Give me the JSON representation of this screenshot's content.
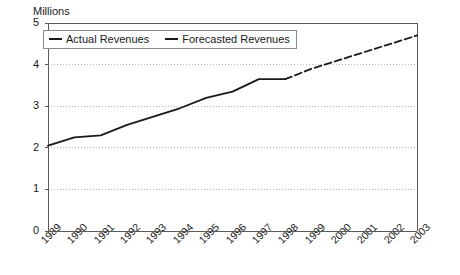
{
  "chart_data": {
    "type": "line",
    "title": "",
    "ylabel": "Millions",
    "xlabel": "",
    "ylim": [
      0,
      5
    ],
    "yticks": [
      "0",
      "1",
      "2",
      "3",
      "4",
      "5"
    ],
    "grid": true,
    "legend_position": "top-left-inside",
    "categories": [
      "1989",
      "1990",
      "1991",
      "1992",
      "1993",
      "1994",
      "1995",
      "1996",
      "1997",
      "1998",
      "1999",
      "2000",
      "2001",
      "2002",
      "2003"
    ],
    "series": [
      {
        "name": "Actual Revenues",
        "style": "solid",
        "color": "#1a1a1a",
        "values": [
          2.05,
          2.25,
          2.3,
          2.55,
          2.75,
          2.95,
          3.2,
          3.35,
          3.65,
          3.65,
          null,
          null,
          null,
          null,
          null
        ]
      },
      {
        "name": "Forecasted Revenues",
        "style": "dashed",
        "color": "#1a1a1a",
        "values": [
          null,
          null,
          null,
          null,
          null,
          null,
          null,
          null,
          null,
          3.65,
          3.9,
          4.1,
          4.3,
          4.5,
          4.7
        ]
      }
    ]
  },
  "legend": {
    "entries": [
      {
        "label": "Actual Revenues"
      },
      {
        "label": "Forecasted Revenues"
      }
    ]
  },
  "axis": {
    "y_title": "Millions"
  }
}
